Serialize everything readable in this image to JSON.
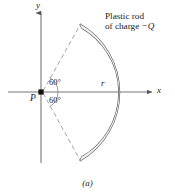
{
  "figure": {
    "caption": "(a)",
    "axes": {
      "x_label": "x",
      "y_label": "y"
    },
    "point": {
      "label": "P"
    },
    "radius_label": "r",
    "angles": [
      {
        "label": "60°"
      },
      {
        "label": "60°"
      }
    ],
    "annotation": {
      "line1": "Plastic rod",
      "line2_prefix": "of charge ",
      "line2_charge": "−Q"
    },
    "colors": {
      "ink": "#1a1a1a",
      "axis": "#555555",
      "rod": "#4a4a4a",
      "dashed": "#8a8a8a",
      "background": "#ffffff"
    },
    "geometry": {
      "origin_x": 41,
      "origin_y": 92,
      "radius": 78,
      "half_angle_deg": 60
    }
  }
}
